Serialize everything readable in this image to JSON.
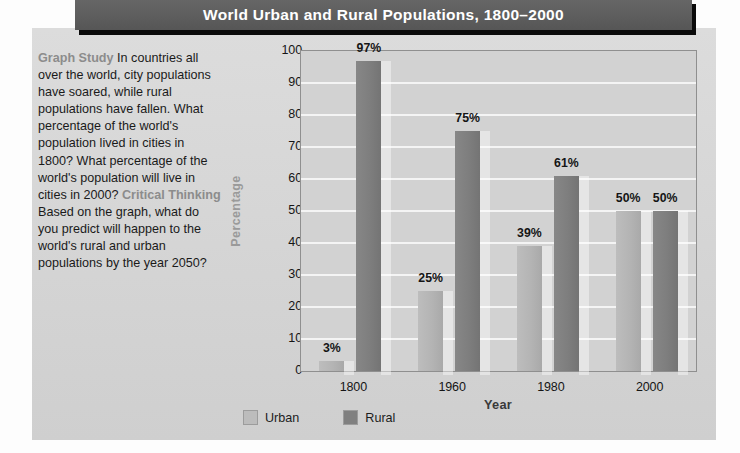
{
  "banner": {
    "title": "World Urban and Rural Populations, 1800–2000"
  },
  "study": {
    "heading1": "Graph Study",
    "body1": " In countries all over the world, city populations have soared, while rural populations have fallen. What percentage of the world's population lived in cities in 1800? What percentage of the world's population will live in cities in 2000? ",
    "heading2": "Critical Thinking",
    "body2": " Based on the graph, what do you predict will happen to the world's rural and urban populations by the year 2050?"
  },
  "chart_data": {
    "type": "bar",
    "title": "World Urban and Rural Populations, 1800–2000",
    "xlabel": "Year",
    "ylabel": "Percentage",
    "categories": [
      "1800",
      "1960",
      "1980",
      "2000"
    ],
    "series": [
      {
        "name": "Urban",
        "color": "#b8b8b8",
        "values": [
          3,
          25,
          39,
          50
        ],
        "labels": [
          "3%",
          "25%",
          "39%",
          "50%"
        ]
      },
      {
        "name": "Rural",
        "color": "#808080",
        "values": [
          97,
          75,
          61,
          50
        ],
        "labels": [
          "97%",
          "75%",
          "61%",
          "50%"
        ]
      }
    ],
    "ylim": [
      0,
      100
    ],
    "yticks": [
      "0",
      "10",
      "20",
      "30",
      "40",
      "50",
      "60",
      "70",
      "80",
      "90",
      "100"
    ],
    "grid": true,
    "legend_position": "bottom"
  },
  "legend": {
    "items": [
      {
        "label": "Urban"
      },
      {
        "label": "Rural"
      }
    ]
  }
}
